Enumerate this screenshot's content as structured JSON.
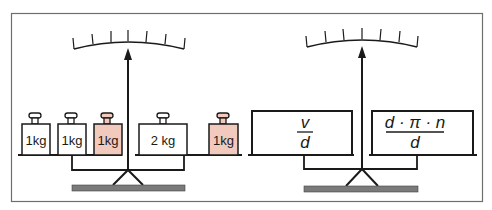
{
  "colors": {
    "frame": "#6e6e6e",
    "ink": "#1a1a1a",
    "highlight_weight": "#f2c9bd",
    "base": "#7a7a7a"
  },
  "left_balance": {
    "left_pan_weights": [
      {
        "label": "1kg",
        "highlighted": false
      },
      {
        "label": "1kg",
        "highlighted": false
      },
      {
        "label": "1kg",
        "highlighted": true
      }
    ],
    "right_pan_weights": [
      {
        "label": "2 kg",
        "highlighted": false
      },
      {
        "label": "1kg",
        "highlighted": true
      }
    ]
  },
  "right_balance": {
    "left_pan": {
      "numerator": "v",
      "denominator": "d"
    },
    "right_pan": {
      "numerator": "d · π · n",
      "denominator": "d"
    }
  }
}
